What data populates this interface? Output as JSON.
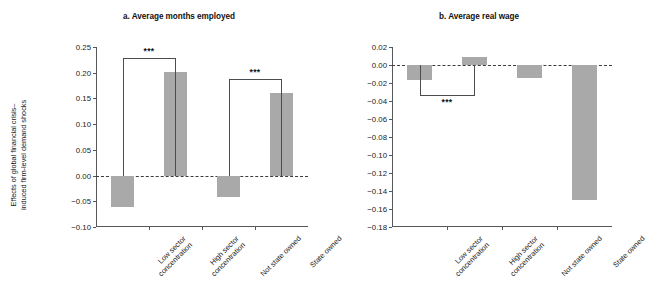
{
  "figure": {
    "ylabel_lines": [
      "Effects of global financial crisis–",
      "induced firm-level demand shocks"
    ],
    "bar_color": "#a9a9a9",
    "axis_color": "#55595c",
    "zero_line_color": "#3a3d40"
  },
  "chart_data": [
    {
      "type": "bar",
      "panel": "a",
      "title": "a. Average months employed",
      "xlabel": "",
      "ylabel": "Effects of global financial crisis–induced firm-level demand shocks",
      "categories": [
        "Low sector concentration",
        "High sector concentration",
        "Not state owned",
        "State owned"
      ],
      "category_lines": [
        [
          "Low sector",
          "concentration"
        ],
        [
          "High sector",
          "concentration"
        ],
        [
          "Not state owned"
        ],
        [
          "State owned"
        ]
      ],
      "values": [
        -0.062,
        0.201,
        -0.042,
        0.161
      ],
      "ylim": [
        -0.1,
        0.25
      ],
      "yticks": [
        0.25,
        0.2,
        0.15,
        0.1,
        0.05,
        0.0,
        -0.05,
        -0.1
      ],
      "ytick_labels": [
        "0.25",
        "0.20",
        "0.15",
        "0.10",
        "0.05",
        "0.00",
        "−0.05",
        "−0.10"
      ],
      "grid": false,
      "legend": "none",
      "annotations": [
        {
          "label": "***",
          "from": 0,
          "to": 1,
          "orientation": "up"
        },
        {
          "label": "***",
          "from": 2,
          "to": 3,
          "orientation": "up"
        }
      ]
    },
    {
      "type": "bar",
      "panel": "b",
      "title": "b. Average real wage",
      "xlabel": "",
      "ylabel": "Effects of global financial crisis–induced firm-level demand shocks",
      "categories": [
        "Low sector concentration",
        "High sector concentration",
        "Not state owned",
        "State owned"
      ],
      "category_lines": [
        [
          "Low sector",
          "concentration"
        ],
        [
          "High sector",
          "concentration"
        ],
        [
          "Not state owned"
        ],
        [
          "State owned"
        ]
      ],
      "values": [
        -0.017,
        0.009,
        -0.014,
        -0.15
      ],
      "ylim": [
        -0.18,
        0.02
      ],
      "yticks": [
        0.02,
        0.0,
        -0.02,
        -0.04,
        -0.06,
        -0.08,
        -0.1,
        -0.12,
        -0.14,
        -0.16,
        -0.18
      ],
      "ytick_labels": [
        "0.02",
        "0.00",
        "−0.02",
        "−0.04",
        "−0.06",
        "−0.08",
        "−0.10",
        "−0.12",
        "−0.14",
        "−0.16",
        "−0.18"
      ],
      "grid": false,
      "legend": "none",
      "annotations": [
        {
          "label": "***",
          "from": 0,
          "to": 1,
          "orientation": "down"
        }
      ]
    }
  ]
}
